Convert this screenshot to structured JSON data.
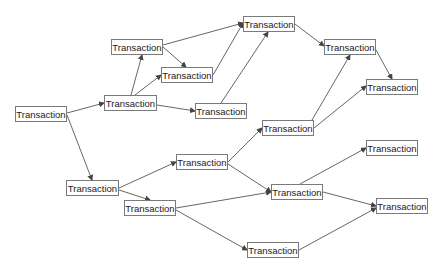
{
  "diagram": {
    "type": "transaction-graph",
    "colors": {
      "edge": "#555555",
      "node_border": "#7a7a7a",
      "text": "#222222"
    },
    "nodes": [
      {
        "id": "A",
        "label": "Transaction",
        "x": 15,
        "y": 106,
        "w": 52,
        "h": 16
      },
      {
        "id": "B",
        "label": "Transaction",
        "x": 104,
        "y": 95,
        "w": 53,
        "h": 16
      },
      {
        "id": "C",
        "label": "Transaction",
        "x": 111,
        "y": 39,
        "w": 52,
        "h": 16
      },
      {
        "id": "D",
        "label": "Transaction",
        "x": 161,
        "y": 67,
        "w": 52,
        "h": 16
      },
      {
        "id": "E",
        "label": "Transaction",
        "x": 195,
        "y": 103,
        "w": 52,
        "h": 16
      },
      {
        "id": "F",
        "label": "Transaction",
        "x": 243,
        "y": 16,
        "w": 52,
        "h": 16
      },
      {
        "id": "G",
        "label": "Transaction",
        "x": 324,
        "y": 39,
        "w": 52,
        "h": 16
      },
      {
        "id": "H",
        "label": "Transaction",
        "x": 262,
        "y": 120,
        "w": 52,
        "h": 16
      },
      {
        "id": "I",
        "label": "Transaction",
        "x": 366,
        "y": 79,
        "w": 52,
        "h": 16
      },
      {
        "id": "J",
        "label": "Transaction",
        "x": 66,
        "y": 180,
        "w": 53,
        "h": 16
      },
      {
        "id": "K",
        "label": "Transaction",
        "x": 124,
        "y": 200,
        "w": 52,
        "h": 16
      },
      {
        "id": "L",
        "label": "Transaction",
        "x": 176,
        "y": 154,
        "w": 52,
        "h": 16
      },
      {
        "id": "M",
        "label": "Transaction",
        "x": 271,
        "y": 184,
        "w": 52,
        "h": 16
      },
      {
        "id": "N",
        "label": "Transaction",
        "x": 366,
        "y": 140,
        "w": 52,
        "h": 16
      },
      {
        "id": "O",
        "label": "Transaction",
        "x": 376,
        "y": 198,
        "w": 52,
        "h": 16
      },
      {
        "id": "P",
        "label": "Transaction",
        "x": 247,
        "y": 242,
        "w": 52,
        "h": 16
      }
    ],
    "edges": [
      {
        "from": [
          67,
          113
        ],
        "to": [
          104,
          103
        ]
      },
      {
        "from": [
          67,
          115
        ],
        "to": [
          92,
          180
        ]
      },
      {
        "from": [
          131,
          95
        ],
        "to": [
          142,
          55
        ]
      },
      {
        "from": [
          135,
          95
        ],
        "to": [
          161,
          75
        ]
      },
      {
        "from": [
          157,
          105
        ],
        "to": [
          195,
          111
        ]
      },
      {
        "from": [
          163,
          45
        ],
        "to": [
          243,
          23
        ]
      },
      {
        "from": [
          163,
          47
        ],
        "to": [
          186,
          67
        ]
      },
      {
        "from": [
          213,
          75
        ],
        "to": [
          243,
          23
        ]
      },
      {
        "from": [
          221,
          103
        ],
        "to": [
          268,
          32
        ]
      },
      {
        "from": [
          295,
          24
        ],
        "to": [
          324,
          46
        ]
      },
      {
        "from": [
          312,
          120
        ],
        "to": [
          350,
          55
        ]
      },
      {
        "from": [
          314,
          128
        ],
        "to": [
          366,
          86
        ]
      },
      {
        "from": [
          376,
          50
        ],
        "to": [
          392,
          79
        ]
      },
      {
        "from": [
          119,
          188
        ],
        "to": [
          176,
          162
        ]
      },
      {
        "from": [
          119,
          190
        ],
        "to": [
          150,
          200
        ]
      },
      {
        "from": [
          228,
          162
        ],
        "to": [
          262,
          128
        ]
      },
      {
        "from": [
          228,
          164
        ],
        "to": [
          271,
          192
        ]
      },
      {
        "from": [
          176,
          208
        ],
        "to": [
          271,
          192
        ]
      },
      {
        "from": [
          176,
          210
        ],
        "to": [
          247,
          250
        ]
      },
      {
        "from": [
          300,
          184
        ],
        "to": [
          366,
          148
        ]
      },
      {
        "from": [
          323,
          192
        ],
        "to": [
          376,
          206
        ]
      },
      {
        "from": [
          299,
          250
        ],
        "to": [
          376,
          208
        ]
      }
    ]
  }
}
